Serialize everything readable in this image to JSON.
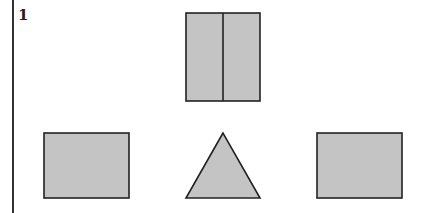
{
  "question": {
    "number": "1"
  },
  "figure": {
    "fill_color": "#c4c4c4",
    "stroke_color": "#222222",
    "shapes": {
      "top": {
        "type": "rectangle",
        "divided": "vertical",
        "x": 186,
        "y": 13,
        "width": 74,
        "height": 88
      },
      "left": {
        "type": "rectangle",
        "x": 44,
        "y": 133,
        "width": 85,
        "height": 65
      },
      "middle": {
        "type": "triangle",
        "apex": [
          223,
          133
        ],
        "base_left": [
          186,
          198
        ],
        "base_right": [
          260,
          198
        ]
      },
      "right": {
        "type": "rectangle",
        "x": 317,
        "y": 133,
        "width": 85,
        "height": 65
      }
    }
  }
}
